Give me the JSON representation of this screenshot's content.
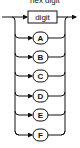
{
  "caption": "hex digit",
  "diagram": {
    "type": "railroad",
    "main": {
      "label": "digit",
      "shape": "box"
    },
    "alternatives": [
      {
        "label": "A",
        "shape": "oval"
      },
      {
        "label": "B",
        "shape": "oval"
      },
      {
        "label": "C",
        "shape": "oval"
      },
      {
        "label": "D",
        "shape": "oval"
      },
      {
        "label": "E",
        "shape": "oval"
      },
      {
        "label": "F",
        "shape": "oval"
      }
    ]
  }
}
